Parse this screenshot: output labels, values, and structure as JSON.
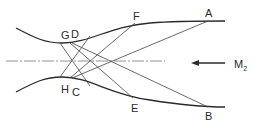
{
  "diagram": {
    "type": "nozzle-characteristics",
    "points": {
      "A": {
        "label": "A",
        "x": 208,
        "y": 21
      },
      "B": {
        "label": "B",
        "x": 208,
        "y": 107
      },
      "C": {
        "label": "C",
        "x": 72,
        "y": 80
      },
      "D": {
        "label": "D",
        "x": 72,
        "y": 42
      },
      "E": {
        "label": "E",
        "x": 133,
        "y": 100
      },
      "F": {
        "label": "F",
        "x": 135,
        "y": 22
      },
      "G": {
        "label": "G",
        "x": 60,
        "y": 43
      },
      "H": {
        "label": "H",
        "x": 60,
        "y": 79
      }
    },
    "flow_label": "M",
    "flow_subscript": "2",
    "colors": {
      "line": "#2a2a2a",
      "centerline": "#777777",
      "background": "#ffffff"
    }
  }
}
